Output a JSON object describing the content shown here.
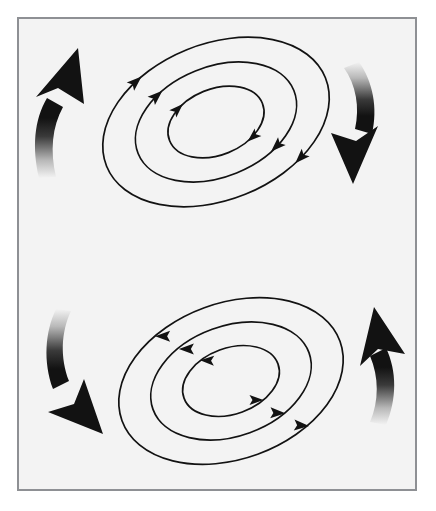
{
  "figure": {
    "background_color": "#f3f3f3",
    "page_color": "#ffffff",
    "stroke_color": "#121212",
    "frame_color": "#8e9094",
    "frame": {
      "x": 17,
      "y": 17,
      "width": 400,
      "height": 474,
      "border_width": 2
    }
  },
  "chart_data": {
    "type": "diagram",
    "cells": [
      {
        "name": "upper-vortex",
        "rotation": "clockwise",
        "center": {
          "x": 216,
          "y": 122
        },
        "tilt_deg": -22,
        "rings": [
          {
            "rx": 118,
            "ry": 78,
            "flow_arrows": 3
          },
          {
            "rx": 84,
            "ry": 55,
            "flow_arrows": 2
          },
          {
            "rx": 50,
            "ry": 33,
            "flow_arrows": 2
          }
        ],
        "side_arrows": [
          {
            "name": "upper-left-arrow",
            "direction": "up",
            "side": "left"
          },
          {
            "name": "upper-right-arrow",
            "direction": "down",
            "side": "right"
          }
        ]
      },
      {
        "name": "lower-vortex",
        "rotation": "counter-clockwise",
        "center": {
          "x": 231,
          "y": 381
        },
        "tilt_deg": -20,
        "rings": [
          {
            "rx": 116,
            "ry": 78,
            "flow_arrows": 2
          },
          {
            "rx": 83,
            "ry": 55,
            "flow_arrows": 2
          },
          {
            "rx": 50,
            "ry": 33,
            "flow_arrows": 2
          }
        ],
        "side_arrows": [
          {
            "name": "lower-left-arrow",
            "direction": "down",
            "side": "left"
          },
          {
            "name": "lower-right-arrow",
            "direction": "up",
            "side": "right"
          }
        ]
      }
    ],
    "legend": [],
    "labels": [],
    "annotations": []
  }
}
